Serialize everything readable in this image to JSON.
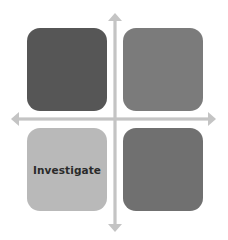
{
  "diagram": {
    "type": "quadrant-matrix",
    "axes": {
      "horizontal": "double-headed-arrow",
      "vertical": "double-headed-arrow",
      "color": "#c4c4c4"
    },
    "quadrants": [
      {
        "position": "top-left",
        "label": "",
        "color": "#565656"
      },
      {
        "position": "top-right",
        "label": "",
        "color": "#7b7b7b"
      },
      {
        "position": "bottom-left",
        "label": "Investigate",
        "color": "#b9b9b9"
      },
      {
        "position": "bottom-right",
        "label": "",
        "color": "#707070"
      }
    ]
  }
}
